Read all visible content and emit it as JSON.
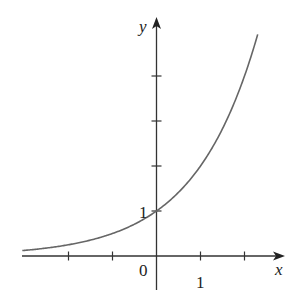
{
  "chart_data": {
    "type": "line",
    "title": "",
    "function": "y = 2^x",
    "xlabel": "x",
    "ylabel": "y",
    "x_tick_labels": [
      {
        "value": 0,
        "label": "0"
      },
      {
        "value": 1,
        "label": "1"
      }
    ],
    "y_tick_labels": [
      {
        "value": 1,
        "label": "1"
      }
    ],
    "x_ticks": [
      -2,
      -1,
      1,
      2
    ],
    "y_ticks": [
      1,
      2,
      3,
      4
    ],
    "xlim": [
      -3.05,
      2.85
    ],
    "ylim": [
      -0.75,
      5.4
    ],
    "grid": false,
    "legend": null,
    "series": [
      {
        "name": "exponential curve",
        "x": [
          -3.05,
          -3,
          -2,
          -1,
          0,
          1,
          1.5,
          2,
          2.2,
          2.3
        ],
        "values": [
          0.12,
          0.125,
          0.25,
          0.5,
          1,
          2,
          2.83,
          4,
          4.59,
          4.92
        ]
      }
    ],
    "color": "#666666"
  },
  "labels": {
    "x_axis": "x",
    "y_axis": "y",
    "origin": "0",
    "x_one": "1",
    "y_one": "1"
  }
}
